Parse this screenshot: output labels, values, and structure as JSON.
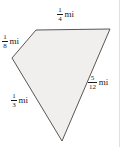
{
  "figure": {
    "name": "quadrilateral-plot-with-side-lengths",
    "shape": {
      "type": "quadrilateral",
      "fill_color": "#f0efee",
      "stroke_color": "#5a5654",
      "vertices": [
        {
          "name": "top-left",
          "x": 36,
          "y": 30
        },
        {
          "name": "top-right",
          "x": 110,
          "y": 29
        },
        {
          "name": "bottom",
          "x": 62,
          "y": 141
        },
        {
          "name": "left",
          "x": 12,
          "y": 58
        }
      ],
      "points_attr": "36,30 110,29 62,141 12,58"
    },
    "background_color": "#ffffff",
    "rule_color": "#e2e0de"
  },
  "labels": {
    "top": {
      "numerator": "1",
      "denominator": "4",
      "unit": "mi",
      "full_text": "1/4 mi",
      "side": "top-edge"
    },
    "upper_left": {
      "numerator": "1",
      "denominator": "8",
      "unit": "mi",
      "full_text": "1/8 mi",
      "side": "upper-left-edge"
    },
    "lower_left": {
      "numerator": "1",
      "denominator": "3",
      "unit": "mi",
      "full_text": "1/3 mi",
      "side": "lower-left-edge"
    },
    "right": {
      "numerator": "5",
      "denominator": "12",
      "unit": "mi",
      "full_text": "5/12 mi",
      "side": "right-edge"
    }
  }
}
